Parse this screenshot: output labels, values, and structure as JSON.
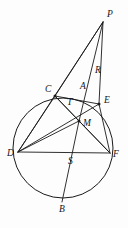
{
  "figure": {
    "kind": "euclidean-geometry-diagram",
    "colors": {
      "background": "#fdfdfd",
      "ink": "#1a1a1a",
      "caption": "#b8b8b8"
    },
    "canvas": {
      "width": 128,
      "height": 228
    },
    "circle": {
      "cx": 63,
      "cy": 148,
      "r": 50,
      "label": "circumscribed-circle"
    },
    "points": [
      {
        "id": "P",
        "label": "P",
        "x": 103,
        "y": 22,
        "lx": 107,
        "ly": 17,
        "dot": false,
        "on_circle": false
      },
      {
        "id": "R",
        "label": "R",
        "x": 93,
        "y": 77,
        "lx": 95,
        "ly": 73,
        "dot": false,
        "on_circle": false
      },
      {
        "id": "C",
        "label": "C",
        "x": 55,
        "y": 96,
        "lx": 45,
        "ly": 92,
        "dot": true,
        "on_circle": true
      },
      {
        "id": "A",
        "label": "A",
        "x": 82,
        "y": 93,
        "lx": 80,
        "ly": 89,
        "dot": false,
        "on_circle": false
      },
      {
        "id": "E",
        "label": "E",
        "x": 99,
        "y": 104,
        "lx": 104,
        "ly": 103,
        "dot": true,
        "on_circle": true
      },
      {
        "id": "T",
        "label": "T",
        "x": 72,
        "y": 107,
        "lx": 67,
        "ly": 105,
        "dot": false,
        "on_circle": false
      },
      {
        "id": "M",
        "label": "M",
        "x": 79,
        "y": 121,
        "lx": 83,
        "ly": 126,
        "dot": true,
        "on_circle": false
      },
      {
        "id": "D",
        "label": "D",
        "x": 18,
        "y": 152,
        "lx": 7,
        "ly": 156,
        "dot": false,
        "on_circle": true
      },
      {
        "id": "S",
        "label": "S",
        "x": 67,
        "y": 156,
        "lx": 68,
        "ly": 164,
        "dot": false,
        "on_circle": false
      },
      {
        "id": "F",
        "label": "F",
        "x": 110,
        "y": 153,
        "lx": 113,
        "ly": 157,
        "dot": false,
        "on_circle": true
      },
      {
        "id": "B",
        "label": "B",
        "x": 62,
        "y": 202,
        "lx": 59,
        "ly": 212,
        "dot": false,
        "on_circle": true
      }
    ],
    "segments": [
      {
        "id": "P-C",
        "from": "P",
        "to": "C",
        "name": "segment-P-C"
      },
      {
        "id": "P-D",
        "from": "P",
        "to": "D",
        "name": "segment-P-D"
      },
      {
        "id": "P-E",
        "from": "P",
        "to": "E",
        "name": "segment-P-E"
      },
      {
        "id": "P-M",
        "from": "P",
        "to": "M",
        "name": "segment-P-M"
      },
      {
        "id": "C-E",
        "from": "C",
        "to": "E",
        "name": "chord-C-E"
      },
      {
        "id": "C-F",
        "from": "C",
        "to": "F",
        "name": "chord-C-F"
      },
      {
        "id": "C-D",
        "from": "C",
        "to": "D",
        "name": "chord-C-D"
      },
      {
        "id": "C-M",
        "from": "C",
        "to": "M",
        "name": "segment-C-M"
      },
      {
        "id": "D-F",
        "from": "D",
        "to": "F",
        "name": "chord-D-F"
      },
      {
        "id": "D-M",
        "from": "D",
        "to": "M",
        "name": "segment-D-M"
      },
      {
        "id": "D-E",
        "from": "D",
        "to": "E",
        "name": "chord-D-E"
      },
      {
        "id": "E-F",
        "from": "E",
        "to": "F",
        "name": "chord-E-F"
      },
      {
        "id": "M-F",
        "from": "M",
        "to": "F",
        "name": "segment-M-F"
      },
      {
        "id": "M-B",
        "from": "M",
        "to": "B",
        "name": "segment-M-B"
      }
    ],
    "caption": ""
  }
}
